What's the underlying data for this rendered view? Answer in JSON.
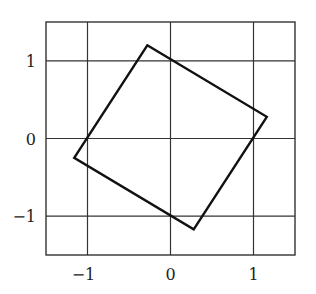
{
  "chart_data": {
    "type": "line",
    "title": "",
    "xlabel": "",
    "ylabel": "",
    "xlim": [
      -1.5,
      1.5
    ],
    "ylim": [
      -1.5,
      1.5
    ],
    "grid": true,
    "legend": "none",
    "xticks": [
      -1,
      0,
      1
    ],
    "yticks": [
      -1,
      0,
      1
    ],
    "xtick_labels": [
      "−1",
      "0",
      "1"
    ],
    "ytick_labels": [
      "−1",
      "0",
      "1"
    ],
    "series": [
      {
        "name": "rotated-square",
        "closed": true,
        "color": "#111111",
        "points": [
          {
            "x": -0.28,
            "y": 1.2
          },
          {
            "x": 1.16,
            "y": 0.28
          },
          {
            "x": 0.28,
            "y": -1.17
          },
          {
            "x": -1.16,
            "y": -0.25
          }
        ]
      }
    ],
    "colors": {
      "grid": "#333333",
      "frame": "#333333",
      "line": "#111111"
    }
  }
}
